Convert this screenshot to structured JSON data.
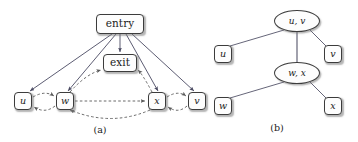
{
  "figure": {
    "background_color": "#ffffff",
    "node_fill": "#fdfdfd",
    "node_stroke": "#3c3c3c",
    "solid_edge_color": "#4a4a62",
    "dashed_edge_color": "#5a5a5a",
    "tree_edge_color": "#55556a"
  },
  "panel_a": {
    "caption": "(a)",
    "nodes": {
      "entry": {
        "label": "entry",
        "shape": "rounded-rect",
        "x": 96,
        "y": 14,
        "w": 48,
        "h": 20
      },
      "exit": {
        "label": "exit",
        "shape": "rounded-rect",
        "x": 103,
        "y": 54,
        "w": 34,
        "h": 18
      },
      "u": {
        "label": "u",
        "shape": "rounded-rect",
        "x": 14,
        "y": 92,
        "w": 18,
        "h": 18
      },
      "w": {
        "label": "w",
        "shape": "rounded-rect",
        "x": 56,
        "y": 92,
        "w": 18,
        "h": 18
      },
      "x": {
        "label": "x",
        "shape": "rounded-rect",
        "x": 148,
        "y": 92,
        "w": 18,
        "h": 18
      },
      "v": {
        "label": "v",
        "shape": "rounded-rect",
        "x": 188,
        "y": 92,
        "w": 18,
        "h": 18
      }
    },
    "solid_edges": [
      {
        "from": "entry",
        "to": "u",
        "style": "solid",
        "arrow": true
      },
      {
        "from": "entry",
        "to": "w",
        "style": "solid",
        "arrow": true
      },
      {
        "from": "entry",
        "to": "exit",
        "style": "solid",
        "arrow": true
      },
      {
        "from": "entry",
        "to": "x",
        "style": "solid",
        "arrow": true
      },
      {
        "from": "entry",
        "to": "v",
        "style": "solid",
        "arrow": true
      }
    ],
    "dashed_edges": [
      {
        "from": "u",
        "to": "w",
        "style": "dashed",
        "arrow": true,
        "curve": "up"
      },
      {
        "from": "w",
        "to": "u",
        "style": "dashed",
        "arrow": true,
        "curve": "down"
      },
      {
        "from": "w",
        "to": "x",
        "style": "dashed",
        "arrow": true,
        "curve": "straight"
      },
      {
        "from": "x",
        "to": "w",
        "style": "dashed",
        "arrow": true,
        "curve": "down"
      },
      {
        "from": "w",
        "to": "exit",
        "style": "dashed",
        "arrow": true,
        "curve": "up"
      },
      {
        "from": "x",
        "to": "exit",
        "style": "dashed",
        "arrow": true,
        "curve": "up"
      },
      {
        "from": "x",
        "to": "v",
        "style": "dashed",
        "arrow": true,
        "curve": "up"
      },
      {
        "from": "v",
        "to": "x",
        "style": "dashed",
        "arrow": true,
        "curve": "down"
      }
    ]
  },
  "panel_b": {
    "caption": "(b)",
    "nodes": {
      "uv": {
        "label": "u, v",
        "shape": "ellipse",
        "x": 78,
        "y": 10,
        "w": 46,
        "h": 22
      },
      "u": {
        "label": "u",
        "shape": "rounded-rect",
        "x": 18,
        "y": 45,
        "w": 18,
        "h": 18
      },
      "v": {
        "label": "v",
        "shape": "rounded-rect",
        "x": 128,
        "y": 45,
        "w": 18,
        "h": 18
      },
      "wx": {
        "label": "w, x",
        "shape": "ellipse",
        "x": 78,
        "y": 62,
        "w": 46,
        "h": 22
      },
      "w": {
        "label": "w",
        "shape": "rounded-rect",
        "x": 18,
        "y": 97,
        "w": 18,
        "h": 18
      },
      "x": {
        "label": "x",
        "shape": "rounded-rect",
        "x": 128,
        "y": 97,
        "w": 18,
        "h": 18
      }
    },
    "tree_edges": [
      {
        "from": "uv",
        "to": "u",
        "style": "solid"
      },
      {
        "from": "uv",
        "to": "v",
        "style": "solid"
      },
      {
        "from": "uv",
        "to": "wx",
        "style": "solid"
      },
      {
        "from": "wx",
        "to": "w",
        "style": "solid"
      },
      {
        "from": "wx",
        "to": "x",
        "style": "solid"
      }
    ]
  }
}
